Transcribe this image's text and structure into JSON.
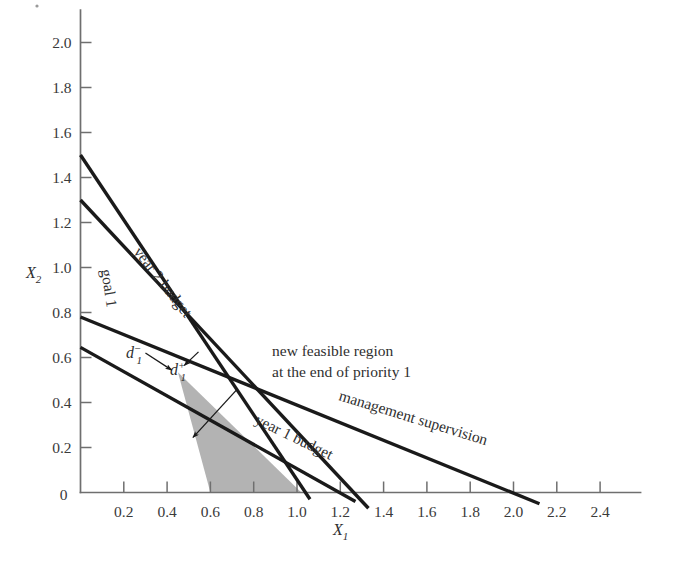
{
  "figure": {
    "title": "",
    "axes": {
      "x_label": "X",
      "x_label_sub": "1",
      "y_label": "X",
      "y_label_sub": "2",
      "x_ticks": [
        "0.2",
        "0.4",
        "0.6",
        "0.8",
        "1.0",
        "1.2",
        "1.4",
        "1.6",
        "1.8",
        "2.0",
        "2.2",
        "2.4"
      ],
      "x_tick_values": [
        0.2,
        0.4,
        0.6,
        0.8,
        1.0,
        1.2,
        1.4,
        1.6,
        1.8,
        2.0,
        2.2,
        2.4
      ],
      "y_ticks": [
        "0.2",
        "0.4",
        "0.6",
        "0.8",
        "1.0",
        "1.2",
        "1.4",
        "1.6",
        "1.8",
        "2.0"
      ],
      "y_tick_values": [
        0.2,
        0.4,
        0.6,
        0.8,
        1.0,
        1.2,
        1.4,
        1.6,
        1.8,
        2.0
      ],
      "origin_label": "0",
      "x_range": [
        0,
        2.55
      ],
      "y_range": [
        0,
        2.1
      ]
    },
    "annotations": {
      "goal1": "goal 1",
      "year2": "year 2 budget",
      "year1": "year 1 budget",
      "management": "management supervision",
      "feasible_line1": "new feasible region",
      "feasible_line2": "at the end of priority 1",
      "d_minus_base": "d",
      "d_minus_sub": "1",
      "d_minus_sup": "−",
      "d_plus_base": "d",
      "d_plus_sub": "1",
      "d_plus_sup": "+"
    },
    "colors": {
      "line": "#1a1a1a",
      "axis": "#6f6f6f",
      "shade_fill": "#b3b3b3",
      "text": "#2f2f2f",
      "background": "#ffffff"
    }
  },
  "chart_data": {
    "type": "line",
    "title": "",
    "xlabel": "X1",
    "ylabel": "X2",
    "xlim": [
      0,
      2.55
    ],
    "ylim": [
      0,
      2.1
    ],
    "grid": false,
    "legend": "inline-annotations",
    "constraint_lines": [
      {
        "name": "goal 1",
        "label": "goal 1",
        "x_intercept": 1.05,
        "y_intercept": 1.5,
        "points": [
          [
            0,
            1.5
          ],
          [
            1.05,
            0
          ]
        ],
        "drawn_from": [
          0,
          1.5
        ],
        "drawn_to": [
          1.06,
          -0.03
        ]
      },
      {
        "name": "year 2 budget",
        "label": "year 2 budget",
        "x_intercept": 1.3,
        "y_intercept": 1.3,
        "points": [
          [
            0,
            1.3
          ],
          [
            1.3,
            0
          ]
        ],
        "drawn_from": [
          0,
          1.3
        ],
        "drawn_to": [
          1.33,
          -0.07
        ]
      },
      {
        "name": "management supervision",
        "label": "management supervision",
        "x_intercept": 2.0,
        "y_intercept": 0.78,
        "points": [
          [
            0,
            0.78
          ],
          [
            2.0,
            0
          ]
        ],
        "drawn_from": [
          0,
          0.78
        ],
        "drawn_to": [
          2.12,
          -0.05
        ]
      },
      {
        "name": "year 1 budget",
        "label": "year 1 budget",
        "x_intercept": 1.2,
        "y_intercept": 0.645,
        "points": [
          [
            0,
            0.645
          ],
          [
            1.2,
            0
          ]
        ],
        "drawn_from": [
          0,
          0.645
        ],
        "drawn_to": [
          1.27,
          -0.04
        ]
      }
    ],
    "feasible_region": {
      "label": "new feasible region at the end of priority 1",
      "fill": "#b3b3b3",
      "vertices": [
        [
          0.45,
          0.535
        ],
        [
          0.6,
          0
        ],
        [
          1.02,
          0
        ]
      ]
    },
    "deviation_arrows": [
      {
        "label": "d1-",
        "from": [
          0.3,
          0.62
        ],
        "to": [
          0.42,
          0.545
        ]
      },
      {
        "label": "d1+",
        "from": [
          0.545,
          0.625
        ],
        "to": [
          0.48,
          0.565
        ]
      }
    ],
    "callout_arrow": {
      "label": "new feasible region at the end of priority 1",
      "from": [
        0.72,
        0.455
      ],
      "to": [
        0.52,
        0.245
      ]
    }
  }
}
